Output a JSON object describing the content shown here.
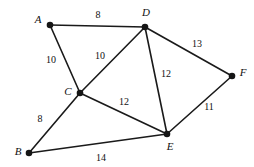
{
  "figure": {
    "type": "weighted-undirected-graph",
    "background_color": "#ffffff",
    "stroke_color": "#1a1a1a",
    "vertex_color": "#151515"
  },
  "vertices": [
    {
      "id": "A",
      "label": "A",
      "x": 50,
      "y": 25,
      "label_x": 38,
      "label_y": 23,
      "anchor": "middle"
    },
    {
      "id": "B",
      "label": "B",
      "x": 29,
      "y": 153,
      "label_x": 18,
      "label_y": 155,
      "anchor": "middle"
    },
    {
      "id": "C",
      "label": "C",
      "x": 80,
      "y": 93,
      "label_x": 68,
      "label_y": 95,
      "anchor": "middle"
    },
    {
      "id": "D",
      "label": "D",
      "x": 145,
      "y": 27,
      "label_x": 146,
      "label_y": 16,
      "anchor": "middle"
    },
    {
      "id": "E",
      "label": "E",
      "x": 167,
      "y": 134,
      "label_x": 170,
      "label_y": 150,
      "anchor": "middle"
    },
    {
      "id": "F",
      "label": "F",
      "x": 232,
      "y": 76,
      "label_x": 243,
      "label_y": 76,
      "anchor": "middle"
    }
  ],
  "edges": [
    {
      "from": "A",
      "to": "D",
      "weight": "8",
      "x1": 50,
      "y1": 25,
      "x2": 145,
      "y2": 27,
      "label_x": 98,
      "label_y": 18
    },
    {
      "from": "A",
      "to": "C",
      "weight": "10",
      "x1": 50,
      "y1": 25,
      "x2": 80,
      "y2": 93,
      "label_x": 51,
      "label_y": 63
    },
    {
      "from": "C",
      "to": "D",
      "weight": "10",
      "x1": 80,
      "y1": 93,
      "x2": 145,
      "y2": 27,
      "label_x": 100,
      "label_y": 59
    },
    {
      "from": "D",
      "to": "F",
      "weight": "13",
      "x1": 145,
      "y1": 27,
      "x2": 232,
      "y2": 76,
      "label_x": 197,
      "label_y": 47
    },
    {
      "from": "D",
      "to": "E",
      "weight": "12",
      "x1": 145,
      "y1": 27,
      "x2": 167,
      "y2": 134,
      "label_x": 166,
      "label_y": 77
    },
    {
      "from": "C",
      "to": "E",
      "weight": "12",
      "x1": 80,
      "y1": 93,
      "x2": 167,
      "y2": 134,
      "label_x": 124,
      "label_y": 105
    },
    {
      "from": "E",
      "to": "F",
      "weight": "11",
      "x1": 167,
      "y1": 134,
      "x2": 232,
      "y2": 76,
      "label_x": 209,
      "label_y": 110
    },
    {
      "from": "B",
      "to": "C",
      "weight": "8",
      "x1": 29,
      "y1": 153,
      "x2": 80,
      "y2": 93,
      "label_x": 40,
      "label_y": 122
    },
    {
      "from": "B",
      "to": "E",
      "weight": "14",
      "x1": 29,
      "y1": 153,
      "x2": 167,
      "y2": 134,
      "label_x": 101,
      "label_y": 161
    }
  ]
}
